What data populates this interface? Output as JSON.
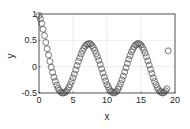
{
  "chart_data": {
    "type": "scatter",
    "title": "",
    "xlabel": "x",
    "ylabel": "y",
    "xlim": [
      0,
      20
    ],
    "ylim": [
      -0.5,
      1
    ],
    "xticks": [
      0,
      5,
      10,
      15,
      20
    ],
    "yticks": [
      -0.5,
      0,
      0.5,
      1
    ],
    "xtick_labels": [
      "0",
      "5",
      "10",
      "15",
      "20"
    ],
    "ytick_labels": [
      "-0.5",
      "0",
      "0.5",
      "1"
    ],
    "grid": true,
    "legend": null,
    "marker": "circle-open",
    "marker_color": "#555555",
    "series": [
      {
        "name": "y",
        "x": [
          0,
          0.2,
          0.4,
          0.6,
          0.8,
          1.0,
          1.2,
          1.4,
          1.6,
          1.8,
          2.0,
          2.2,
          2.4,
          2.6,
          2.8,
          3.0,
          3.2,
          3.4,
          3.6,
          3.8,
          4.0,
          4.2,
          4.4,
          4.6,
          4.8,
          5.0,
          5.2,
          5.4,
          5.6,
          5.8,
          6.0,
          6.2,
          6.4,
          6.6,
          6.8,
          7.0,
          7.2,
          7.4,
          7.6,
          7.8,
          8.0,
          8.2,
          8.4,
          8.6,
          8.8,
          9.0,
          9.2,
          9.4,
          9.6,
          9.8,
          10.0,
          10.2,
          10.4,
          10.6,
          10.8,
          11.0,
          11.2,
          11.4,
          11.6,
          11.8,
          12.0,
          12.2,
          12.4,
          12.6,
          12.8,
          13.0,
          13.2,
          13.4,
          13.6,
          13.8,
          14.0,
          14.2,
          14.4,
          14.6,
          14.8,
          15.0,
          15.2,
          15.4,
          15.6,
          15.8,
          16.0,
          16.2,
          16.4,
          16.6,
          16.8,
          17.0,
          17.2,
          17.4,
          17.6,
          17.8,
          18.0,
          18.2,
          18.4,
          18.6,
          18.8,
          19.0
        ],
        "values": [
          0.97,
          0.91,
          0.82,
          0.71,
          0.59,
          0.46,
          0.34,
          0.22,
          0.1,
          -0.01,
          -0.11,
          -0.2,
          -0.28,
          -0.35,
          -0.41,
          -0.45,
          -0.48,
          -0.5,
          -0.5,
          -0.49,
          -0.47,
          -0.44,
          -0.39,
          -0.34,
          -0.28,
          -0.21,
          -0.14,
          -0.06,
          0.02,
          0.1,
          0.17,
          0.24,
          0.3,
          0.35,
          0.39,
          0.42,
          0.43,
          0.44,
          0.43,
          0.4,
          0.36,
          0.31,
          0.25,
          0.19,
          0.12,
          0.04,
          -0.04,
          -0.12,
          -0.2,
          -0.27,
          -0.34,
          -0.39,
          -0.44,
          -0.47,
          -0.49,
          -0.5,
          -0.49,
          -0.47,
          -0.43,
          -0.38,
          -0.32,
          -0.25,
          -0.18,
          -0.1,
          -0.02,
          0.06,
          0.14,
          0.21,
          0.28,
          0.33,
          0.38,
          0.41,
          0.43,
          0.44,
          0.43,
          0.41,
          0.37,
          0.32,
          0.26,
          0.19,
          0.11,
          0.03,
          -0.05,
          -0.13,
          -0.21,
          -0.28,
          -0.34,
          -0.4,
          -0.44,
          -0.47,
          -0.49,
          -0.5,
          -0.49,
          -0.46,
          -0.42,
          0.3
        ]
      }
    ]
  }
}
